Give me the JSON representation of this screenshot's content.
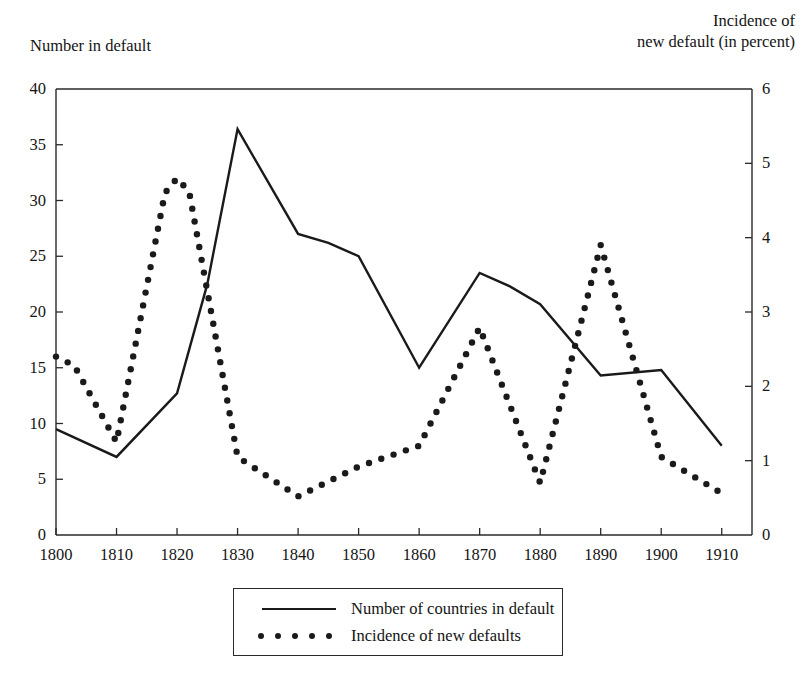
{
  "chart_data": {
    "type": "line",
    "title": "",
    "subtitle": "",
    "xlabel": "",
    "ylabel": "Number in default",
    "y2label": "Incidence of new default (in percent)",
    "ylabel_line1": "Number in default",
    "y2label_line1": "Incidence of",
    "y2label_line2": "new default (in percent)",
    "grid": false,
    "legend_position": "bottom-center",
    "xlim": [
      1800,
      1915
    ],
    "ylim": [
      0,
      40
    ],
    "y2lim": [
      0,
      6
    ],
    "xticks": [
      1800,
      1810,
      1820,
      1830,
      1840,
      1850,
      1860,
      1870,
      1880,
      1890,
      1900,
      1910
    ],
    "xtick_labels": [
      "1800",
      "1810",
      "1820",
      "1830",
      "1840",
      "1850",
      "1860",
      "1870",
      "1880",
      "1890",
      "1900",
      "1910"
    ],
    "yticks": [
      0,
      5,
      10,
      15,
      20,
      25,
      30,
      35,
      40
    ],
    "ytick_labels": [
      "0",
      "5",
      "10",
      "15",
      "20",
      "25",
      "30",
      "35",
      "40"
    ],
    "y2ticks": [
      0,
      1,
      2,
      3,
      4,
      5,
      6
    ],
    "y2tick_labels": [
      "0",
      "1",
      "2",
      "3",
      "4",
      "5",
      "6"
    ],
    "series": [
      {
        "name": "Number of countries in default",
        "style": "solid",
        "axis": "left",
        "color": "#1a1a1a",
        "x": [
          1800,
          1810,
          1820,
          1825,
          1830,
          1840,
          1845,
          1850,
          1860,
          1870,
          1875,
          1880,
          1890,
          1900,
          1910
        ],
        "values": [
          9.5,
          7.0,
          12.7,
          22.5,
          36.4,
          27.0,
          26.2,
          25.0,
          15.0,
          23.5,
          22.3,
          20.7,
          14.3,
          14.8,
          8.0
        ]
      },
      {
        "name": "Incidence of new defaults",
        "style": "dotted",
        "axis": "right",
        "color": "#1a1a1a",
        "x": [
          1800,
          1803,
          1810,
          1818,
          1820,
          1822,
          1830,
          1840,
          1850,
          1860,
          1870,
          1880,
          1890,
          1900,
          1910
        ],
        "values": [
          2.4,
          2.28,
          1.25,
          4.6,
          4.8,
          4.62,
          1.05,
          0.52,
          0.92,
          1.2,
          2.79,
          0.7,
          3.9,
          1.05,
          0.56
        ],
        "values_left_scale": [
          16.0,
          15.2,
          8.3,
          30.7,
          32.0,
          30.8,
          7.0,
          3.5,
          6.1,
          8.0,
          18.6,
          4.7,
          26.0,
          7.0,
          3.7
        ]
      }
    ]
  },
  "legend": {
    "items": [
      {
        "label": "Number of countries in default",
        "style": "solid"
      },
      {
        "label": "Incidence of new defaults",
        "style": "dotted"
      }
    ]
  }
}
